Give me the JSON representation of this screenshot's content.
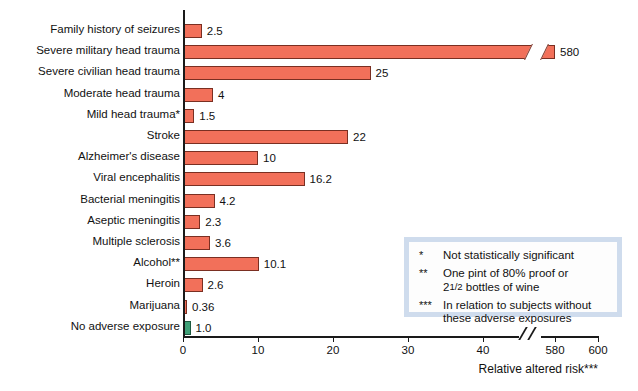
{
  "chart_data": {
    "type": "bar",
    "orientation": "horizontal",
    "title": "",
    "subtitle": "",
    "xlabel": "Relative altered risk***",
    "ylabel": "",
    "grid": false,
    "legend_position": "inside-bottom-right",
    "xlim": [
      0,
      600
    ],
    "axis_break": {
      "present": true,
      "between": [
        40,
        580
      ],
      "note": "x-axis is broken between 40 and 580"
    },
    "xticks": [
      {
        "label": "0",
        "value": 0
      },
      {
        "label": "10",
        "value": 10
      },
      {
        "label": "20",
        "value": 20
      },
      {
        "label": "30",
        "value": 30
      },
      {
        "label": "40",
        "value": 40
      },
      {
        "label": "580",
        "value": 580
      },
      {
        "label": "600",
        "value": 600
      }
    ],
    "categories": [
      "Family history of seizures",
      "Severe military head trauma",
      "Severe civilian head trauma",
      "Moderate head trauma",
      "Mild head trauma*",
      "Stroke",
      "Alzheimer's disease",
      "Viral encephalitis",
      "Bacterial meningitis",
      "Aseptic meningitis",
      "Multiple sclerosis",
      "Alcohol**",
      "Heroin",
      "Marijuana",
      "No adverse exposure"
    ],
    "values": [
      2.5,
      580,
      25,
      4,
      1.5,
      22,
      10,
      16.2,
      4.2,
      2.3,
      3.6,
      10.1,
      2.6,
      0.36,
      1.0
    ],
    "value_labels": [
      "2.5",
      "580",
      "25",
      "4",
      "1.5",
      "22",
      "10",
      "16.2",
      "4.2",
      "2.3",
      "3.6",
      "10.1",
      "2.6",
      "0.36",
      "1.0"
    ],
    "highlight_index": 14,
    "colors": {
      "bar": "#f2705a",
      "bar_border": "#7a2f22",
      "reference_bar": "#3fa077",
      "reference_bar_border": "#1d5a40",
      "axis": "#1a1a1a",
      "text": "#111111",
      "legend_border": "#cfdced",
      "legend_background": "#fdfdfd"
    }
  },
  "footnotes": [
    {
      "marker": "*",
      "line1": "Not statistically significant",
      "line2": ""
    },
    {
      "marker": "**",
      "line1": "One pint of 80% proof or",
      "line2": "bottles of wine",
      "fraction_prefix": "2",
      "fraction": "1/2"
    },
    {
      "marker": "***",
      "line1": "In relation to subjects without",
      "line2": "these adverse exposures"
    }
  ]
}
